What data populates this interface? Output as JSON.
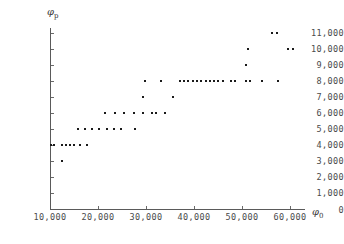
{
  "chart_data": {
    "type": "scatter",
    "title": "",
    "xlabel": "φ₀",
    "ylabel": "φₚ",
    "xlim": [
      10000,
      65000
    ],
    "ylim": [
      0,
      11500
    ],
    "grid": false,
    "legend": null,
    "xticks": [
      10000,
      20000,
      30000,
      40000,
      50000,
      60000
    ],
    "xticklabels": [
      "10,000",
      "20,000",
      "30,000",
      "40,000",
      "50,000",
      "60,000"
    ],
    "yticks": [
      0,
      1000,
      2000,
      3000,
      4000,
      5000,
      6000,
      7000,
      8000,
      9000,
      10000,
      11000
    ],
    "yticklabels": [
      "0",
      "1,000",
      "2,000",
      "3,000",
      "4,000",
      "5,000",
      "6,000",
      "7,000",
      "8,000",
      "9,000",
      "10,000",
      "11,000"
    ],
    "marker": "square",
    "marker_color": "#1a1a1a",
    "points": [
      [
        10200,
        4000
      ],
      [
        10800,
        4000
      ],
      [
        12500,
        4000
      ],
      [
        13300,
        4000
      ],
      [
        14200,
        4000
      ],
      [
        15000,
        4000
      ],
      [
        16300,
        4000
      ],
      [
        17700,
        4000
      ],
      [
        12500,
        3000
      ],
      [
        15800,
        5000
      ],
      [
        17300,
        5000
      ],
      [
        18800,
        5000
      ],
      [
        20300,
        5000
      ],
      [
        21800,
        5000
      ],
      [
        23300,
        5000
      ],
      [
        24800,
        5000
      ],
      [
        27700,
        5000
      ],
      [
        21500,
        6000
      ],
      [
        23500,
        6000
      ],
      [
        25500,
        6000
      ],
      [
        27500,
        6000
      ],
      [
        29400,
        6000
      ],
      [
        31300,
        6000
      ],
      [
        32100,
        6000
      ],
      [
        34000,
        6000
      ],
      [
        29400,
        7000
      ],
      [
        35600,
        7000
      ],
      [
        29800,
        8000
      ],
      [
        33200,
        8000
      ],
      [
        37000,
        8000
      ],
      [
        37900,
        8000
      ],
      [
        38800,
        8000
      ],
      [
        39700,
        8000
      ],
      [
        40600,
        8000
      ],
      [
        41500,
        8000
      ],
      [
        42400,
        8000
      ],
      [
        43300,
        8000
      ],
      [
        44200,
        8000
      ],
      [
        45100,
        8000
      ],
      [
        46000,
        8000
      ],
      [
        47700,
        8000
      ],
      [
        48600,
        8000
      ],
      [
        50800,
        8000
      ],
      [
        51700,
        8000
      ],
      [
        54200,
        8000
      ],
      [
        57500,
        8000
      ],
      [
        50800,
        9000
      ],
      [
        51200,
        10000
      ],
      [
        59600,
        10000
      ],
      [
        60600,
        10000
      ],
      [
        56300,
        11000
      ],
      [
        57300,
        11000
      ]
    ]
  }
}
